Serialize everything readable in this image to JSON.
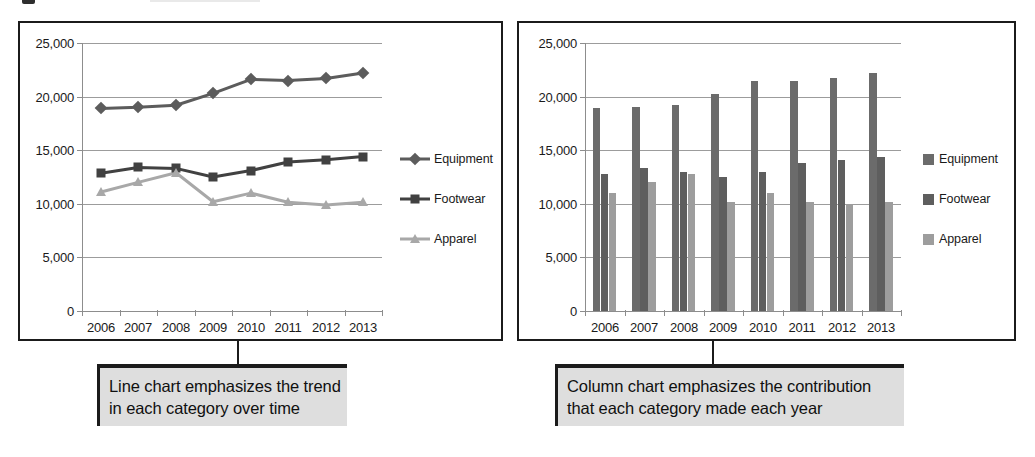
{
  "page": {
    "background": "#ffffff",
    "accent_dark": "#5f5f5f",
    "accent_mid": "#4a4a4a",
    "accent_light": "#a3a3a3"
  },
  "chart_data": [
    {
      "id": "line-chart",
      "type": "line",
      "title": "",
      "xlabel": "",
      "ylabel": "",
      "categories": [
        "2006",
        "2007",
        "2008",
        "2009",
        "2010",
        "2011",
        "2012",
        "2013"
      ],
      "ylim": [
        0,
        25000
      ],
      "yticks": [
        0,
        5000,
        10000,
        15000,
        20000,
        25000
      ],
      "ytick_labels": [
        "0",
        "5,000",
        "10,000",
        "15,000",
        "20,000",
        "25,000"
      ],
      "grid": true,
      "legend_position": "right",
      "series": [
        {
          "name": "Equipment",
          "marker": "diamond",
          "color": "#5c5c5c",
          "values": [
            18900,
            19000,
            19200,
            20300,
            21600,
            21500,
            21700,
            22200
          ]
        },
        {
          "name": "Footwear",
          "marker": "square",
          "color": "#414141",
          "values": [
            12850,
            13400,
            13300,
            12500,
            13100,
            13900,
            14100,
            14400
          ]
        },
        {
          "name": "Apparel",
          "marker": "triangle",
          "color": "#a8a8a8",
          "values": [
            11100,
            12000,
            12900,
            10200,
            11000,
            10150,
            9900,
            10150
          ]
        }
      ]
    },
    {
      "id": "column-chart",
      "type": "bar",
      "title": "",
      "xlabel": "",
      "ylabel": "",
      "categories": [
        "2006",
        "2007",
        "2008",
        "2009",
        "2010",
        "2011",
        "2012",
        "2013"
      ],
      "ylim": [
        0,
        25000
      ],
      "yticks": [
        0,
        5000,
        10000,
        15000,
        20000,
        25000
      ],
      "ytick_labels": [
        "0",
        "5,000",
        "10,000",
        "15,000",
        "20,000",
        "25,000"
      ],
      "grid": true,
      "legend_position": "right",
      "series": [
        {
          "name": "Equipment",
          "color": "#6b6b6b",
          "values": [
            18900,
            19050,
            19200,
            20250,
            21500,
            21450,
            21700,
            22200
          ]
        },
        {
          "name": "Footwear",
          "color": "#5e5e5e",
          "values": [
            12750,
            13300,
            13000,
            12500,
            13000,
            13800,
            14100,
            14400
          ]
        },
        {
          "name": "Apparel",
          "color": "#9d9d9d",
          "values": [
            11050,
            12000,
            12800,
            10200,
            11000,
            10150,
            10000,
            10150
          ]
        }
      ]
    }
  ],
  "callouts": {
    "line": {
      "name": "line-chart-callout",
      "line1": "Line chart emphasizes the trend",
      "line2": "in each category over time"
    },
    "column": {
      "name": "column-chart-callout",
      "line1": "Column chart emphasizes the contribution",
      "line2": "that each category made each year"
    }
  }
}
